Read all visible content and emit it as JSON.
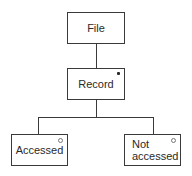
{
  "diagram": {
    "notation": "Jackson structure diagram",
    "nodes": [
      {
        "id": "file",
        "label": "File",
        "marker": "none"
      },
      {
        "id": "record",
        "label": "Record",
        "marker": "iteration",
        "marker_symbol": "*"
      },
      {
        "id": "accessed",
        "label": "Accessed",
        "marker": "selection",
        "marker_symbol": "o"
      },
      {
        "id": "not_accessed",
        "label": "Not\naccessed",
        "marker": "selection",
        "marker_symbol": "o"
      }
    ],
    "edges": [
      {
        "from": "file",
        "to": "record"
      },
      {
        "from": "record",
        "to": "accessed"
      },
      {
        "from": "record",
        "to": "not_accessed"
      }
    ]
  },
  "colors": {
    "line": "#3a3a3a",
    "text": "#2a2a2a",
    "background": "#ffffff"
  }
}
